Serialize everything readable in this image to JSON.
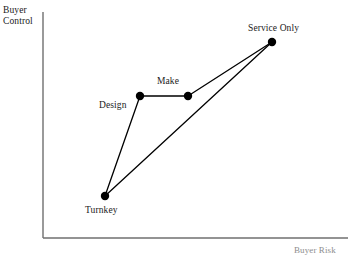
{
  "figure": {
    "title": "",
    "background_color": "#ffffff",
    "axis_color": "#6b6b6b",
    "line_color": "#000000",
    "marker_color": "#000000"
  },
  "axes": {
    "y_title": "Buyer\nControl",
    "x_title": "Buyer Risk",
    "y_axis_x_px": 43,
    "x_axis_y_px": 238,
    "origin_label": ""
  },
  "chart_data": {
    "type": "scatter",
    "title": "",
    "xlabel": "Buyer Risk",
    "ylabel": "Buyer Control",
    "xlim": [
      0,
      100
    ],
    "ylim": [
      0,
      100
    ],
    "grid": false,
    "legend": "none",
    "points": [
      {
        "name": "Turnkey",
        "label": "Turnkey",
        "x": 26.8,
        "y": 21.4,
        "px": 105,
        "py": 196
      },
      {
        "name": "Design",
        "label": "Design",
        "x": 39.2,
        "y": 72.3,
        "px": 140,
        "py": 96
      },
      {
        "name": "Make",
        "label": "Make",
        "x": 56.1,
        "y": 72.3,
        "px": 188,
        "py": 96
      },
      {
        "name": "Service Only",
        "label": "Service Only",
        "x": 85.7,
        "y": 96.9,
        "px": 272,
        "py": 42
      }
    ],
    "connections": [
      {
        "from": "Turnkey",
        "to": "Design"
      },
      {
        "from": "Design",
        "to": "Make"
      },
      {
        "from": "Make",
        "to": "Service Only"
      },
      {
        "from": "Turnkey",
        "to": "Service Only"
      }
    ]
  }
}
